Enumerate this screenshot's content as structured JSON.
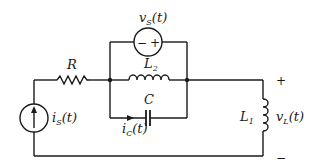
{
  "diagram": {
    "type": "circuit",
    "components": {
      "resistor": {
        "label": "R"
      },
      "inductor_parallel": {
        "label": "L",
        "sub": "2"
      },
      "capacitor": {
        "label": "C"
      },
      "inductor_load": {
        "label": "L",
        "sub": "1"
      },
      "voltage_source": {
        "label": "v",
        "sub": "S",
        "arg": "(t)",
        "minus": "−",
        "plus": "+"
      },
      "current_source": {
        "label": "i",
        "sub": "S",
        "arg": "(t)"
      },
      "capacitor_current": {
        "label": "i",
        "sub": "C",
        "arg": "(t)"
      },
      "load_voltage": {
        "label": "v",
        "sub": "L",
        "arg": "(t)",
        "plus": "+",
        "minus": "−"
      }
    },
    "colors": {
      "ink": "#1a1a1a",
      "background": "#ffffff"
    }
  }
}
